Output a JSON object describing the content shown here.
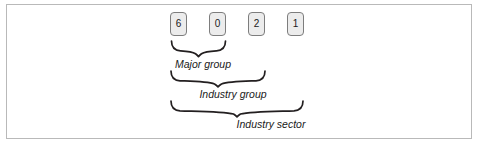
{
  "figure": {
    "type": "code-structure-diagram",
    "code_digits": [
      {
        "value": "6",
        "position": 1
      },
      {
        "value": "0",
        "position": 2
      },
      {
        "value": "2",
        "position": 3
      },
      {
        "value": "1",
        "position": 4
      }
    ],
    "groupings": [
      {
        "id": "major-group",
        "label": "Major group",
        "covers_digits": [
          1,
          2
        ]
      },
      {
        "id": "industry-group",
        "label": "Industry group",
        "covers_digits": [
          1,
          2,
          3
        ]
      },
      {
        "id": "industry-sector",
        "label": "Industry sector",
        "covers_digits": [
          1,
          2,
          3,
          4
        ]
      }
    ]
  },
  "colors": {
    "frame_border": "#b9b9b9",
    "box_fill": "#ececec",
    "box_border": "#7d7d7d",
    "brace_stroke": "#231f20",
    "text": "#1a1a1a",
    "background": "#ffffff"
  }
}
